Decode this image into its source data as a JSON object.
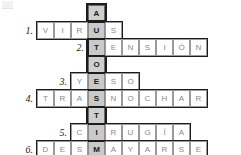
{
  "puzzle": {
    "type": "crossword",
    "language": "es",
    "keyword": "AUTOESTIMA",
    "keyword_letters": [
      "A",
      "U",
      "T",
      "O",
      "E",
      "S",
      "T",
      "I",
      "M",
      "A"
    ],
    "rows": [
      {
        "number": "1.",
        "answer": "VIRUS",
        "letters": [
          "V",
          "I",
          "R",
          "U",
          "S"
        ],
        "key_index": 3
      },
      {
        "number": "2.",
        "answer": "TENSIÓN",
        "letters": [
          "T",
          "E",
          "N",
          "S",
          "I",
          "Ó",
          "N"
        ],
        "key_index": 0
      },
      {
        "number": "3.",
        "answer": "YESO",
        "letters": [
          "Y",
          "E",
          "S",
          "O"
        ],
        "key_index": 1
      },
      {
        "number": "4.",
        "answer": "TRASNOCHAR",
        "letters": [
          "T",
          "R",
          "A",
          "S",
          "N",
          "O",
          "C",
          "H",
          "A",
          "R"
        ],
        "key_index": 3
      },
      {
        "number": "5.",
        "answer": "CIRUGÍA",
        "letters": [
          "C",
          "I",
          "R",
          "U",
          "G",
          "Í",
          "A"
        ],
        "key_index": 1
      },
      {
        "number": "6.",
        "answer": "DESMAYARSE",
        "letters": [
          "D",
          "E",
          "S",
          "M",
          "A",
          "Y",
          "A",
          "R",
          "S",
          "E"
        ],
        "key_index": 3
      }
    ],
    "colors": {
      "cell_border": "#9a9a9a",
      "frame": "#1c1c1c",
      "highlight": "#c9c9c9",
      "letter": "#8a8a8a",
      "key_letter": "#1a1a1a",
      "background": "#ffffff"
    }
  }
}
